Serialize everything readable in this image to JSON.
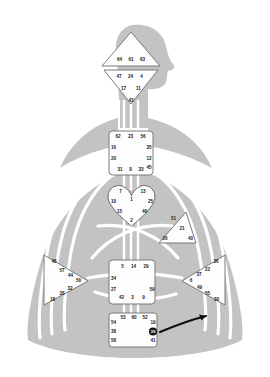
{
  "chart_data": {
    "type": "diagram",
    "subtitle": "",
    "colors": {
      "body_silhouette": "#c3c3c3",
      "channel_line": "#ffffff",
      "center_fill": "#fdfdfd",
      "center_stroke": "#8f8f8f",
      "gate_text": "#1b1b1b",
      "highlight_marker": "#161616",
      "arrow": "#0d0d0d",
      "page_background": "#ffffff"
    },
    "centers": [
      {
        "id": "head",
        "name": "Head Center",
        "shape": "triangle-up",
        "gates": [
          {
            "number": "64",
            "x": 119.5,
            "y": 59.5
          },
          {
            "number": "61",
            "x": 131.0,
            "y": 59.5
          },
          {
            "number": "63",
            "x": 142.5,
            "y": 59.5
          }
        ]
      },
      {
        "id": "ajna",
        "name": "Ajna Center",
        "shape": "triangle-down",
        "gates": [
          {
            "number": "47",
            "x": 119.0,
            "y": 76.5
          },
          {
            "number": "24",
            "x": 130.5,
            "y": 76.5
          },
          {
            "number": "4",
            "x": 141.5,
            "y": 76.5
          },
          {
            "number": "17",
            "x": 123.5,
            "y": 89.0
          },
          {
            "number": "11",
            "x": 138.5,
            "y": 89.0
          },
          {
            "number": "43",
            "x": 131.0,
            "y": 101.0
          }
        ]
      },
      {
        "id": "throat",
        "name": "Throat Center",
        "shape": "square",
        "gates": [
          {
            "number": "62",
            "x": 118.0,
            "y": 136.5
          },
          {
            "number": "23",
            "x": 130.5,
            "y": 136.5
          },
          {
            "number": "56",
            "x": 143.0,
            "y": 136.5
          },
          {
            "number": "16",
            "x": 113.5,
            "y": 148.0
          },
          {
            "number": "35",
            "x": 149.0,
            "y": 148.0
          },
          {
            "number": "20",
            "x": 113.5,
            "y": 158.5
          },
          {
            "number": "12",
            "x": 149.0,
            "y": 158.5
          },
          {
            "number": "45",
            "x": 149.0,
            "y": 167.5
          },
          {
            "number": "31",
            "x": 120.0,
            "y": 170.0
          },
          {
            "number": "8",
            "x": 130.5,
            "y": 170.0
          },
          {
            "number": "33",
            "x": 141.0,
            "y": 170.0
          }
        ]
      },
      {
        "id": "g",
        "name": "G Center",
        "shape": "heart",
        "gates": [
          {
            "number": "7",
            "x": 120.5,
            "y": 192.0
          },
          {
            "number": "13",
            "x": 143.0,
            "y": 192.0
          },
          {
            "number": "10",
            "x": 113.5,
            "y": 201.5
          },
          {
            "number": "1",
            "x": 131.5,
            "y": 200.0
          },
          {
            "number": "25",
            "x": 150.5,
            "y": 201.5
          },
          {
            "number": "15",
            "x": 119.5,
            "y": 211.5
          },
          {
            "number": "46",
            "x": 144.5,
            "y": 211.5
          },
          {
            "number": "2",
            "x": 131.5,
            "y": 221.0
          }
        ]
      },
      {
        "id": "heart",
        "name": "Heart / Ego Center",
        "shape": "triangle-left",
        "gates": [
          {
            "number": "51",
            "x": 173.5,
            "y": 219.0
          },
          {
            "number": "21",
            "x": 182.0,
            "y": 229.0
          },
          {
            "number": "26",
            "x": 165.0,
            "y": 238.5
          },
          {
            "number": "40",
            "x": 190.5,
            "y": 238.5
          }
        ]
      },
      {
        "id": "spleen",
        "name": "Spleen Center",
        "shape": "triangle-right",
        "gates": [
          {
            "number": "48",
            "x": 54.0,
            "y": 262.0
          },
          {
            "number": "57",
            "x": 62.0,
            "y": 270.5
          },
          {
            "number": "44",
            "x": 70.5,
            "y": 276.0
          },
          {
            "number": "50",
            "x": 78.5,
            "y": 281.0
          },
          {
            "number": "32",
            "x": 70.0,
            "y": 288.5
          },
          {
            "number": "28",
            "x": 62.0,
            "y": 293.5
          },
          {
            "number": "18",
            "x": 52.5,
            "y": 299.5
          }
        ]
      },
      {
        "id": "sacral",
        "name": "Sacral Center",
        "shape": "square",
        "gates": [
          {
            "number": "5",
            "x": 122.5,
            "y": 266.5
          },
          {
            "number": "14",
            "x": 133.5,
            "y": 266.5
          },
          {
            "number": "29",
            "x": 146.0,
            "y": 266.5
          },
          {
            "number": "34",
            "x": 113.5,
            "y": 278.5
          },
          {
            "number": "27",
            "x": 113.5,
            "y": 289.5
          },
          {
            "number": "59",
            "x": 152.0,
            "y": 289.5
          },
          {
            "number": "42",
            "x": 121.5,
            "y": 297.5
          },
          {
            "number": "3",
            "x": 132.5,
            "y": 297.5
          },
          {
            "number": "9",
            "x": 143.5,
            "y": 297.5
          }
        ]
      },
      {
        "id": "solar-plexus",
        "name": "Solar Plexus Center",
        "shape": "triangle-left",
        "gates": [
          {
            "number": "36",
            "x": 216.0,
            "y": 262.0
          },
          {
            "number": "22",
            "x": 207.5,
            "y": 269.5
          },
          {
            "number": "37",
            "x": 199.0,
            "y": 275.0
          },
          {
            "number": "6",
            "x": 191.0,
            "y": 280.5
          },
          {
            "number": "49",
            "x": 199.5,
            "y": 288.0
          },
          {
            "number": "55",
            "x": 207.5,
            "y": 293.5
          },
          {
            "number": "30",
            "x": 216.5,
            "y": 299.5
          }
        ]
      },
      {
        "id": "root",
        "name": "Root Center",
        "shape": "square",
        "gates": [
          {
            "number": "53",
            "x": 123.0,
            "y": 317.5
          },
          {
            "number": "60",
            "x": 134.0,
            "y": 317.5
          },
          {
            "number": "52",
            "x": 145.0,
            "y": 317.5
          },
          {
            "number": "54",
            "x": 113.5,
            "y": 322.5
          },
          {
            "number": "19",
            "x": 153.0,
            "y": 322.5
          },
          {
            "number": "38",
            "x": 113.5,
            "y": 331.5
          },
          {
            "number": "39",
            "x": 153.0,
            "y": 331.5,
            "highlighted": true
          },
          {
            "number": "58",
            "x": 113.5,
            "y": 340.5
          },
          {
            "number": "41",
            "x": 153.0,
            "y": 340.5
          }
        ]
      }
    ],
    "annotation": {
      "type": "curved-arrow",
      "label": "",
      "points_to_gate": "39",
      "marker": "filled-circle"
    }
  }
}
